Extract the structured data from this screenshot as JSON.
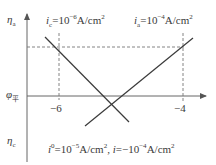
{
  "diagram": {
    "type": "tafel-plot",
    "axes": {
      "y_top_label": "η",
      "y_top_sub": "a",
      "y_bottom_label": "η",
      "y_bottom_sub": "c",
      "y_mid_label": "φ",
      "y_mid_sub": "平"
    },
    "ticks": {
      "left": "−6",
      "right": "−4"
    },
    "annotations": {
      "ic_prefix": "i",
      "ic_sub": "c",
      "ic_eq": "=10",
      "ic_exp": "−6",
      "ic_unit": "A/cm",
      "ic_unit_exp": "2",
      "ia_prefix": "i",
      "ia_sub": "a",
      "ia_eq": "=10",
      "ia_exp": "−4",
      "ia_unit": "A/cm",
      "ia_unit_exp": "2",
      "bottom_i0": "i",
      "bottom_i0_sup": "0",
      "bottom_i0_eq": "=10",
      "bottom_i0_exp": "−5",
      "bottom_i0_unit": "A/cm",
      "bottom_i0_unit_exp": "2",
      "bottom_sep": ", ",
      "bottom_i": "i",
      "bottom_i_eq": "=−10",
      "bottom_i_exp": "−4",
      "bottom_i_unit": "A/cm",
      "bottom_i_unit_exp": "2"
    },
    "colors": {
      "line": "#3a3a3a",
      "axis": "#555555",
      "dashed": "#777777"
    }
  }
}
